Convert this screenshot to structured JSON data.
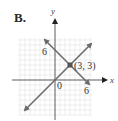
{
  "panel_label": "B.",
  "axes": {
    "x_label": "x",
    "y_label": "y",
    "origin_label": "0",
    "x_tick_label": "6",
    "y_tick_label": "6"
  },
  "point": {
    "label": "(3, 3)",
    "x": 3,
    "y": 3
  },
  "lines": [
    {
      "name": "line-y-equals-x",
      "slope": 1,
      "intercept": 0
    },
    {
      "name": "line-x-plus-y-equals-6",
      "slope": -1,
      "intercept": 6
    }
  ],
  "colors": {
    "line": "#6b6b6b",
    "grid": "#e2e2e2",
    "axis": "#333333"
  }
}
